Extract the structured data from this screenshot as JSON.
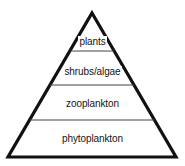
{
  "diagram": {
    "type": "pyramid",
    "shape_name": "trophic-pyramid",
    "tier_count": 4,
    "colors": {
      "outline": "#111111",
      "divider": "#444444",
      "background": "#ffffff",
      "text": "#141414"
    },
    "tiers": [
      {
        "index": 1,
        "position": "top",
        "label": "plants"
      },
      {
        "index": 2,
        "position": "upper-middle",
        "label": "shrubs/algae"
      },
      {
        "index": 3,
        "position": "lower-middle",
        "label": "zooplankton"
      },
      {
        "index": 4,
        "position": "bottom",
        "label": "phytoplankton"
      }
    ]
  }
}
